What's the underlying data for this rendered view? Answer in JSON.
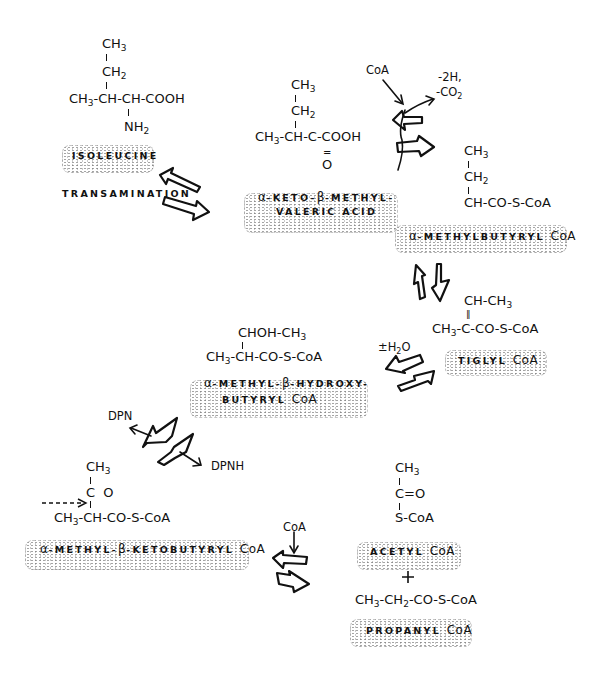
{
  "diagram": {
    "type": "metabolic-pathway",
    "topic": "Isoleucine degradation pathway",
    "nodes": [
      {
        "id": "isoleucine",
        "label": "ISOLEUCINE",
        "structure": {
          "line1": "CH3",
          "line2": "CH2",
          "line3": "CH3-CH-CH-COOH",
          "line4": "NH2"
        }
      },
      {
        "id": "keto-methyl-valeric-acid",
        "label_line1": "α-KETO-β-METHYL-",
        "label_line2": "VALERIC ACID",
        "structure": {
          "line1": "CH3",
          "line2": "CH2",
          "line3": "CH3-CH-C-COOH",
          "line4": "O"
        }
      },
      {
        "id": "methylbutyryl-coa",
        "label": "α-METHYLBUTYRYL CoA",
        "structure": {
          "line1": "CH3",
          "line2": "CH2",
          "line3": "CH-CO-S-CoA"
        }
      },
      {
        "id": "tiglyl-coa",
        "label": "TIGLYL CoA",
        "structure": {
          "line1": "CH-CH3",
          "line2": "CH3-C-CO-S-CoA"
        }
      },
      {
        "id": "methyl-hydroxybutyryl-coa",
        "label_line1": "α-METHYL-β-HYDROXY-",
        "label_line2": "BUTYRYL CoA",
        "structure": {
          "line1": "CHOH-CH3",
          "line2": "CH3-CH-CO-S-CoA"
        }
      },
      {
        "id": "methyl-ketobutyryl-coa",
        "label": "α-METHYL-β-KETOBUTYRYL CoA",
        "structure": {
          "line1": "CH3",
          "line2": "C  O",
          "line3": "CH3-CH-CO-S-CoA"
        }
      },
      {
        "id": "acetyl-coa",
        "label": "ACETYL CoA",
        "structure": {
          "line1": "CH3",
          "line2": "C=O",
          "line3": "S-CoA"
        }
      },
      {
        "id": "propanyl-coa",
        "label": "PROPANYL CoA",
        "structure": {
          "line1": "CH3-CH2-CO-S-CoA"
        }
      }
    ],
    "reactions": [
      {
        "from": "isoleucine",
        "to": "keto-methyl-valeric-acid",
        "label": "TRANSAMINATION",
        "reversible": true
      },
      {
        "from": "keto-methyl-valeric-acid",
        "to": "methylbutyryl-coa",
        "input": "CoA",
        "output": "-2H, -CO2",
        "reversible": true
      },
      {
        "from": "methylbutyryl-coa",
        "to": "tiglyl-coa",
        "reversible": true
      },
      {
        "from": "tiglyl-coa",
        "to": "methyl-hydroxybutyryl-coa",
        "label": "±H2O",
        "reversible": true
      },
      {
        "from": "methyl-hydroxybutyryl-coa",
        "to": "methyl-ketobutyryl-coa",
        "input": "DPN",
        "output": "DPNH",
        "reversible": true
      },
      {
        "from": "methyl-ketobutyryl-coa",
        "to": [
          "acetyl-coa",
          "propanyl-coa"
        ],
        "input": "CoA",
        "reversible": true
      }
    ],
    "annotations": {
      "transamination": "TRANSAMINATION",
      "coa_1": "CoA",
      "minus_2h": "-2H,",
      "co2": "CO",
      "co2_sub": "2",
      "water": "±H",
      "water_sub": "2",
      "water_o": "O",
      "dpn": "DPN",
      "dpnh": "DPNH",
      "coa_2": "CoA",
      "plus": "+"
    },
    "colors": {
      "ink": "#111111",
      "stipple": "#5a5a5a",
      "background": "#ffffff"
    }
  }
}
